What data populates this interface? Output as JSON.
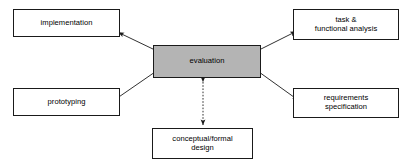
{
  "diagram": {
    "type": "star-relationship-diagram",
    "background_color": "#ffffff",
    "center_fill_color": "#b4b4b4",
    "line_color": "#1a1a1a",
    "nodes": [
      {
        "id": "implementation",
        "label": "implementation",
        "role": "satellite",
        "position": "top-left"
      },
      {
        "id": "task_functional_analysis",
        "label": "task &\nfunctional analysis",
        "role": "satellite",
        "position": "top-right"
      },
      {
        "id": "evaluation",
        "label": "evaluation",
        "role": "center",
        "position": "center"
      },
      {
        "id": "prototyping",
        "label": "prototyping",
        "role": "satellite",
        "position": "bottom-left"
      },
      {
        "id": "requirements_specification",
        "label": "requirements\nspecification",
        "role": "satellite",
        "position": "bottom-right"
      },
      {
        "id": "conceptual_formal_design",
        "label": "conceptual/formal\ndesign",
        "role": "satellite",
        "position": "bottom-center"
      }
    ],
    "edges": [
      {
        "from": "evaluation",
        "to": "implementation",
        "style": "solid",
        "arrows": "both"
      },
      {
        "from": "evaluation",
        "to": "task_functional_analysis",
        "style": "solid",
        "arrows": "both"
      },
      {
        "from": "evaluation",
        "to": "prototyping",
        "style": "solid",
        "arrows": "both"
      },
      {
        "from": "evaluation",
        "to": "requirements_specification",
        "style": "solid",
        "arrows": "both"
      },
      {
        "from": "evaluation",
        "to": "conceptual_formal_design",
        "style": "dashed",
        "arrows": "both"
      }
    ]
  }
}
